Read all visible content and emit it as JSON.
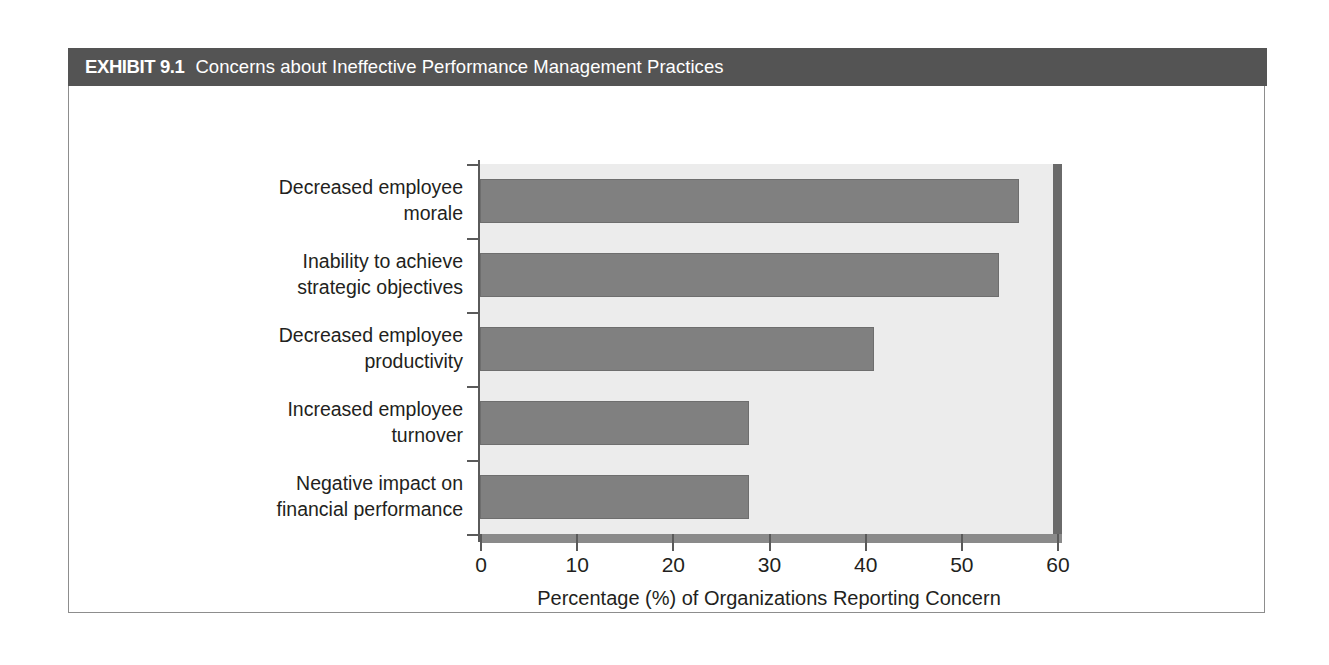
{
  "exhibit": {
    "label": "EXHIBIT 9.1",
    "title": "Concerns about Ineffective Performance Management Practices",
    "header_color": "#545454",
    "card_border_color": "#8d8d8d"
  },
  "chart_data": {
    "type": "bar",
    "orientation": "horizontal",
    "title": "Concerns about Ineffective Performance Management Practices",
    "categories": [
      "Decreased employee\nmorale",
      "Inability to achieve\nstrategic objectives",
      "Decreased employee\nproductivity",
      "Increased employee\nturnover",
      "Negative impact on\nfinancial performance"
    ],
    "values": [
      56,
      54,
      41,
      28,
      28
    ],
    "xlabel": "Percentage (%) of Organizations Reporting Concern",
    "ylabel": "",
    "xlim": [
      0,
      60
    ],
    "xticks": [
      0,
      10,
      20,
      30,
      40,
      50,
      60
    ],
    "xtick_labels": [
      "0",
      "10",
      "20",
      "30",
      "40",
      "50",
      "60"
    ],
    "grid": false,
    "legend": false,
    "bar_color": "#808080",
    "plot_background": "#ececec",
    "axis_color": "#5a5a5a"
  }
}
